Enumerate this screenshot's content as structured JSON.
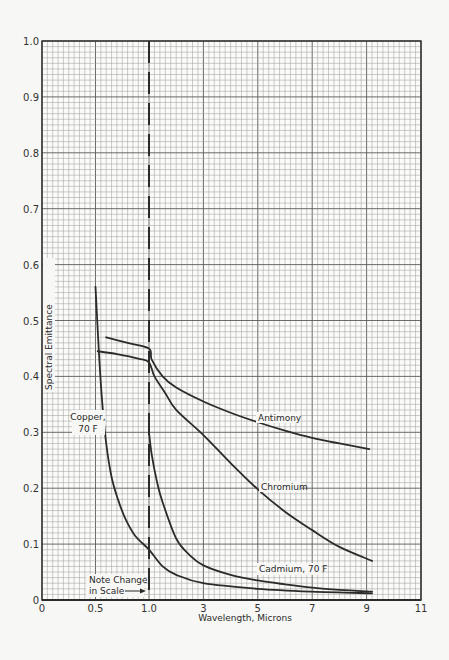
{
  "chart_data": {
    "type": "line",
    "title": "",
    "xlabel": "Wavelength, Microns",
    "ylabel": "Spectral Emittance",
    "xlim": [
      0,
      11
    ],
    "ylim": [
      0,
      1.0
    ],
    "grid": true,
    "x_scale_note": "Note Change in Scale",
    "x_scale_break": 1.0,
    "x_ticks": [
      {
        "value": 0,
        "label": "0"
      },
      {
        "value": 0.5,
        "label": "0.5"
      },
      {
        "value": 1.0,
        "label": "1.0"
      },
      {
        "value": 3,
        "label": "3"
      },
      {
        "value": 5,
        "label": "5"
      },
      {
        "value": 7,
        "label": "7"
      },
      {
        "value": 9,
        "label": "9"
      },
      {
        "value": 11,
        "label": "11"
      }
    ],
    "y_ticks": [
      {
        "value": 0,
        "label": "0"
      },
      {
        "value": 0.1,
        "label": "0.1"
      },
      {
        "value": 0.2,
        "label": "0.2"
      },
      {
        "value": 0.3,
        "label": "0.3"
      },
      {
        "value": 0.4,
        "label": "0.4"
      },
      {
        "value": 0.5,
        "label": "0.5"
      },
      {
        "value": 0.6,
        "label": "0.6"
      },
      {
        "value": 0.7,
        "label": "0.7"
      },
      {
        "value": 0.8,
        "label": "0.8"
      },
      {
        "value": 0.9,
        "label": "0.9"
      },
      {
        "value": 1.0,
        "label": "1.0"
      }
    ],
    "series": [
      {
        "name": "Antimony",
        "label": "Antimony",
        "x": [
          0.6,
          0.8,
          1.0,
          1.1,
          1.5,
          2,
          3,
          4,
          5,
          6,
          7,
          8,
          9.1
        ],
        "y": [
          0.47,
          0.46,
          0.45,
          0.43,
          0.4,
          0.38,
          0.355,
          0.335,
          0.318,
          0.303,
          0.29,
          0.28,
          0.27
        ]
      },
      {
        "name": "Chromium",
        "label": "Chromium",
        "x": [
          0.52,
          0.7,
          0.9,
          1.0,
          1.2,
          1.6,
          2,
          3,
          4,
          5,
          6,
          7,
          8,
          9.2
        ],
        "y": [
          0.445,
          0.44,
          0.432,
          0.425,
          0.4,
          0.37,
          0.34,
          0.295,
          0.245,
          0.198,
          0.158,
          0.125,
          0.095,
          0.07
        ]
      },
      {
        "name": "Cadmium, 70 F",
        "label": "Cadmium, 70 F",
        "x": [
          1.0,
          1.1,
          1.3,
          1.5,
          2,
          2.5,
          3,
          4,
          5,
          6,
          7,
          8,
          9.2
        ],
        "y": [
          0.3,
          0.26,
          0.21,
          0.175,
          0.11,
          0.08,
          0.062,
          0.045,
          0.035,
          0.028,
          0.022,
          0.018,
          0.015
        ]
      },
      {
        "name": "Copper, 70 F",
        "label": "Copper, 70 F",
        "x": [
          0.5,
          0.53,
          0.56,
          0.6,
          0.65,
          0.71,
          0.78,
          0.87,
          1.0,
          1.5,
          2,
          3,
          5,
          7,
          9.2
        ],
        "y": [
          0.56,
          0.45,
          0.36,
          0.28,
          0.22,
          0.18,
          0.145,
          0.115,
          0.09,
          0.06,
          0.045,
          0.03,
          0.02,
          0.015,
          0.012
        ]
      }
    ],
    "annotations": [
      {
        "text": "Copper,",
        "x": 0.63,
        "y": 0.335
      },
      {
        "text": "70 F",
        "x": 0.63,
        "y": 0.305
      },
      {
        "text": "Antimony",
        "x": 4.5,
        "y": 0.325
      },
      {
        "text": "Chromium",
        "x": 5.7,
        "y": 0.215
      },
      {
        "text": "Cadmium, 70 F",
        "x": 5.4,
        "y": 0.045
      },
      {
        "text": "Note Change",
        "x": 0.85,
        "y": 0.04
      },
      {
        "text": "in Scale",
        "x": 0.75,
        "y": 0.015
      }
    ]
  },
  "labels": {
    "xlabel": "Wavelength, Microns",
    "ylabel": "Spectral Emittance",
    "note_line1": "Note Change",
    "note_line2": "in Scale",
    "copper_line1": "Copper,",
    "copper_line2": "70 F",
    "antimony": "Antimony",
    "chromium": "Chromium",
    "cadmium": "Cadmium, 70 F"
  },
  "colors": {
    "line": "#2b2b2b",
    "grid_minor": "#9a9a9a",
    "grid_major": "#5a5a5a",
    "background": "#f7f7f5"
  }
}
